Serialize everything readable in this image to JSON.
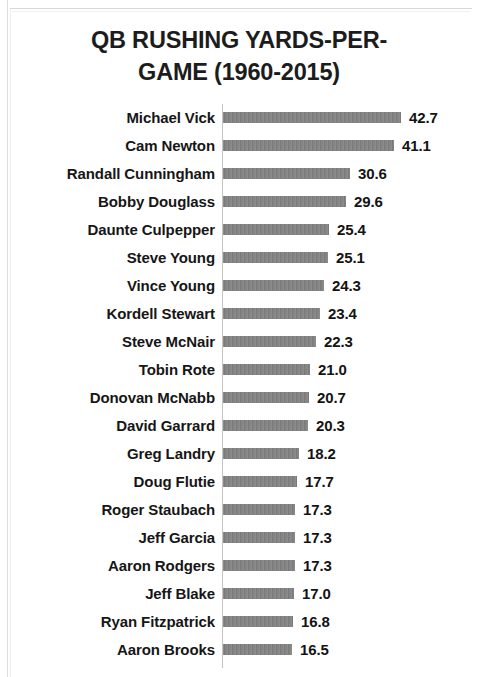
{
  "chart_data": {
    "type": "bar",
    "orientation": "horizontal",
    "title_lines": [
      "QB RUSHING YARDS-PER-",
      "GAME (1960-2015)"
    ],
    "xlabel": "",
    "ylabel": "",
    "grid": false,
    "legend": false,
    "xlim": [
      0,
      42.7
    ],
    "bar_color": "#7f7f7f",
    "axis_color": "#c4c4c4",
    "text_color": "#161616",
    "categories": [
      "Michael Vick",
      "Cam Newton",
      "Randall Cunningham",
      "Bobby Douglass",
      "Daunte Culpepper",
      "Steve Young",
      "Vince Young",
      "Kordell Stewart",
      "Steve McNair",
      "Tobin Rote",
      "Donovan McNabb",
      "David Garrard",
      "Greg Landry",
      "Doug Flutie",
      "Roger Staubach",
      "Jeff Garcia",
      "Aaron Rodgers",
      "Jeff Blake",
      "Ryan Fitzpatrick",
      "Aaron Brooks"
    ],
    "values": [
      42.7,
      41.1,
      30.6,
      29.6,
      25.4,
      25.1,
      24.3,
      23.4,
      22.3,
      21.0,
      20.7,
      20.3,
      18.2,
      17.7,
      17.3,
      17.3,
      17.3,
      17.0,
      16.8,
      16.5
    ],
    "value_labels": [
      "42.7",
      "41.1",
      "30.6",
      "29.6",
      "25.4",
      "25.1",
      "24.3",
      "23.4",
      "22.3",
      "21.0",
      "20.7",
      "20.3",
      "18.2",
      "17.7",
      "17.3",
      "17.3",
      "17.3",
      "17.0",
      "16.8",
      "16.5"
    ]
  }
}
